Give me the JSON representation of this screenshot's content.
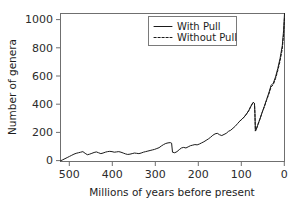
{
  "figure": {
    "background": "#ffffff",
    "line_color": "#1a1a1a",
    "frame_color": "#6f6f6f"
  },
  "chart_data": {
    "type": "line",
    "title": "",
    "xlabel": "Millions of years before present",
    "ylabel": "Number of genera",
    "xlim": [
      500,
      0
    ],
    "ylim": [
      0,
      1050
    ],
    "x_ticks": [
      500,
      400,
      300,
      200,
      100,
      0
    ],
    "y_ticks": [
      0,
      200,
      400,
      600,
      800,
      1000
    ],
    "x_tick_labels": [
      "500",
      "400",
      "300",
      "200",
      "100",
      "0"
    ],
    "y_tick_labels": [
      "0",
      "200",
      "400",
      "600",
      "800",
      "1000"
    ],
    "x_axis_reversed": true,
    "grid": false,
    "legend_position": "top-center",
    "legend": [
      "With Pull",
      "Without Pull"
    ],
    "series": [
      {
        "name": "With Pull",
        "style": "solid",
        "x": [
          500,
          495,
          490,
          485,
          480,
          475,
          470,
          465,
          460,
          455,
          450,
          445,
          440,
          435,
          430,
          425,
          420,
          415,
          410,
          405,
          400,
          395,
          390,
          385,
          380,
          375,
          370,
          365,
          360,
          355,
          350,
          345,
          340,
          335,
          330,
          325,
          320,
          315,
          310,
          305,
          300,
          295,
          290,
          285,
          280,
          275,
          270,
          265,
          260,
          255,
          252,
          250,
          245,
          240,
          235,
          230,
          225,
          220,
          215,
          210,
          205,
          200,
          195,
          190,
          185,
          180,
          175,
          170,
          165,
          160,
          155,
          150,
          145,
          140,
          135,
          130,
          125,
          120,
          115,
          110,
          105,
          100,
          95,
          90,
          85,
          80,
          75,
          70,
          67,
          66,
          65,
          63,
          60,
          55,
          50,
          45,
          40,
          35,
          30,
          25,
          20,
          15,
          10,
          5,
          2,
          0
        ],
        "y": [
          5,
          12,
          20,
          28,
          36,
          44,
          52,
          58,
          62,
          66,
          70,
          58,
          48,
          52,
          58,
          64,
          68,
          62,
          56,
          60,
          66,
          70,
          72,
          70,
          66,
          68,
          70,
          66,
          60,
          54,
          50,
          52,
          56,
          60,
          58,
          56,
          60,
          66,
          70,
          74,
          78,
          82,
          86,
          92,
          98,
          110,
          120,
          128,
          132,
          134,
          130,
          66,
          62,
          70,
          84,
          96,
          100,
          96,
          104,
          112,
          116,
          120,
          118,
          124,
          132,
          140,
          150,
          160,
          172,
          186,
          196,
          200,
          190,
          184,
          192,
          200,
          214,
          222,
          236,
          250,
          268,
          286,
          300,
          316,
          336,
          360,
          392,
          420,
          412,
          340,
          216,
          228,
          256,
          300,
          348,
          392,
          440,
          486,
          540,
          556,
          600,
          660,
          730,
          820,
          930,
          1050
        ]
      },
      {
        "name": "Without Pull",
        "style": "dashed",
        "x": [
          100,
          95,
          90,
          85,
          80,
          75,
          70,
          67,
          66,
          65,
          63,
          60,
          55,
          50,
          45,
          40,
          35,
          30,
          25,
          20,
          15,
          10,
          5,
          2,
          0
        ],
        "y": [
          286,
          300,
          316,
          336,
          360,
          392,
          420,
          412,
          340,
          216,
          228,
          256,
          300,
          346,
          388,
          434,
          478,
          528,
          546,
          588,
          644,
          712,
          798,
          902,
          1020
        ]
      }
    ]
  },
  "axes": {
    "y_label": "Number of genera",
    "x_label": "Millions of years before present"
  },
  "legend": {
    "items": [
      {
        "label": "With Pull",
        "style": "solid"
      },
      {
        "label": "Without Pull",
        "style": "dashed"
      }
    ]
  }
}
